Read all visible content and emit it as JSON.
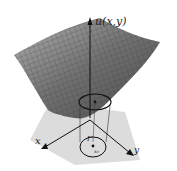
{
  "figure": {
    "axis_labels": {
      "u": "u(x,y)",
      "x": "x",
      "y": "y"
    },
    "domain_labels": {
      "boundary": "Γ",
      "point": "x₀"
    },
    "colors": {
      "surface": "#6e6e6e",
      "surface_light": "#a8a8a8",
      "plane": "#d9d9d9",
      "axes": "#222222"
    }
  }
}
